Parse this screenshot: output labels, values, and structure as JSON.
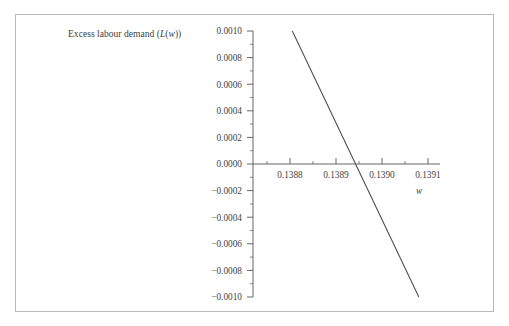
{
  "figure": {
    "background_color": "#ffffff",
    "frame_color": "#b9b9b9",
    "title_prefix": "Excess labour demand (",
    "title_math_l": "L",
    "title_mid": "(",
    "title_math_w": "w",
    "title_suffix": "))",
    "title_full": "Excess labour demand (L(w))",
    "x_axis_name": "w"
  },
  "chart_data": {
    "type": "line",
    "title": "Excess labour demand (L(w))",
    "xlabel": "w",
    "ylabel": "Excess labour demand (L(w))",
    "xlim": [
      0.13875,
      0.139125
    ],
    "ylim": [
      -0.001,
      0.001
    ],
    "grid": false,
    "legend": null,
    "axis_style": "crossed-axes-at-zero",
    "x_ticks": [
      0.1388,
      0.1389,
      0.139,
      0.1391
    ],
    "x_tick_labels": [
      "0.1388",
      "0.1389",
      "0.1390",
      "0.1391"
    ],
    "x_minor_ticks": [
      0.13875,
      0.13885,
      0.13895,
      0.13905,
      0.13915
    ],
    "y_ticks": [
      0.001,
      0.0008,
      0.0006,
      0.0004,
      0.0002,
      0.0,
      -0.0002,
      -0.0004,
      -0.0006,
      -0.0008,
      -0.001
    ],
    "y_tick_labels": [
      "0.0010",
      "0.0008",
      "0.0006",
      "0.0004",
      "0.0002",
      "0.0000",
      "−0.0002",
      "−0.0004",
      "−0.0006",
      "−0.0008",
      "−0.0010"
    ],
    "y_minor_ticks": [
      0.0009,
      0.0007,
      0.0005,
      0.0003,
      0.0001,
      -0.0001,
      -0.0003,
      -0.0005,
      -0.0007,
      -0.0009
    ],
    "series": [
      {
        "name": "L(w)",
        "color": "#4a4a4a",
        "x": [
          0.138805,
          0.13908
        ],
        "y": [
          0.001,
          -0.001
        ],
        "root_x": 0.1388945,
        "slope": -7.2727
      }
    ]
  },
  "geometry": {
    "plot_left_px": 253,
    "plot_right_px": 440,
    "y_top_px": 31,
    "y_bottom_px": 297,
    "zero_y_px": 164,
    "x_origin_value": 0.1388,
    "x_origin_px": 290,
    "px_per_x_unit": 460000
  }
}
